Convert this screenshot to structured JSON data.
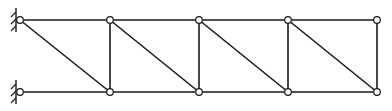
{
  "diagram": {
    "type": "truss",
    "colors": {
      "line": "#1a1a1a",
      "node_fill": "#ffffff",
      "background": "#ffffff"
    },
    "nodes": [
      {
        "id": "T0",
        "x": 20,
        "y": 20
      },
      {
        "id": "T1",
        "x": 110,
        "y": 20
      },
      {
        "id": "T2",
        "x": 199,
        "y": 20
      },
      {
        "id": "T3",
        "x": 288,
        "y": 20
      },
      {
        "id": "T4",
        "x": 377,
        "y": 20
      },
      {
        "id": "B0",
        "x": 20,
        "y": 92
      },
      {
        "id": "B1",
        "x": 110,
        "y": 92
      },
      {
        "id": "B2",
        "x": 199,
        "y": 92
      },
      {
        "id": "B3",
        "x": 288,
        "y": 92
      },
      {
        "id": "B4",
        "x": 377,
        "y": 92
      }
    ],
    "members": [
      {
        "from": "T0",
        "to": "T1",
        "kind": "top-chord"
      },
      {
        "from": "T1",
        "to": "T2",
        "kind": "top-chord"
      },
      {
        "from": "T2",
        "to": "T3",
        "kind": "top-chord"
      },
      {
        "from": "T3",
        "to": "T4",
        "kind": "top-chord"
      },
      {
        "from": "B0",
        "to": "B1",
        "kind": "bottom-chord"
      },
      {
        "from": "B1",
        "to": "B2",
        "kind": "bottom-chord"
      },
      {
        "from": "B2",
        "to": "B3",
        "kind": "bottom-chord"
      },
      {
        "from": "B3",
        "to": "B4",
        "kind": "bottom-chord"
      },
      {
        "from": "T1",
        "to": "B1",
        "kind": "vertical"
      },
      {
        "from": "T2",
        "to": "B2",
        "kind": "vertical"
      },
      {
        "from": "T3",
        "to": "B3",
        "kind": "vertical"
      },
      {
        "from": "T4",
        "to": "B4",
        "kind": "vertical"
      },
      {
        "from": "T0",
        "to": "B1",
        "kind": "diagonal"
      },
      {
        "from": "T1",
        "to": "B2",
        "kind": "diagonal"
      },
      {
        "from": "T2",
        "to": "B3",
        "kind": "diagonal"
      },
      {
        "from": "T3",
        "to": "B4",
        "kind": "diagonal"
      }
    ],
    "supports": [
      {
        "node": "T0",
        "type": "pin-wall"
      },
      {
        "node": "B0",
        "type": "pin-wall"
      }
    ]
  }
}
